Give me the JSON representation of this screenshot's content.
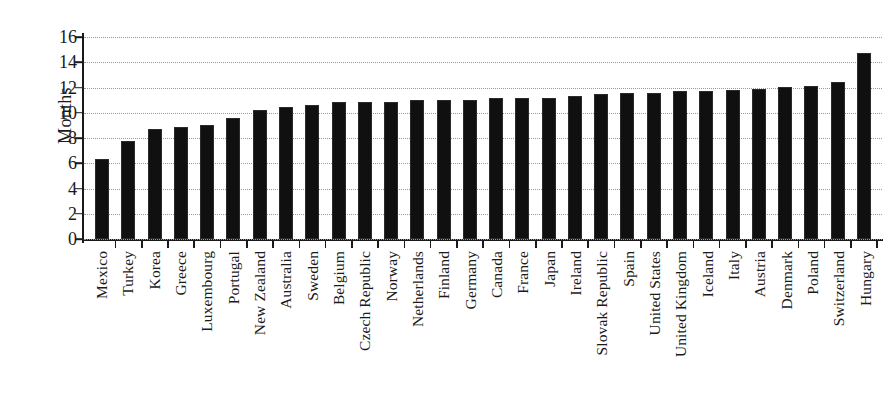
{
  "chart_data": {
    "type": "bar",
    "title": "",
    "xlabel": "",
    "ylabel": "Months",
    "ylim": [
      0,
      16
    ],
    "yticks": [
      0,
      2,
      4,
      6,
      8,
      10,
      12,
      14,
      16
    ],
    "grid": true,
    "legend": "none",
    "orientation": "vertical",
    "bar_color": "#101010",
    "categories": [
      "Mexico",
      "Turkey",
      "Korea",
      "Greece",
      "Luxembourg",
      "Portugal",
      "New Zealand",
      "Australia",
      "Sweden",
      "Belgium",
      "Czech Republic",
      "Norway",
      "Netherlands",
      "Finland",
      "Germany",
      "Canada",
      "France",
      "Japan",
      "Ireland",
      "Slovak Republic",
      "Spain",
      "United States",
      "United Kingdom",
      "Iceland",
      "Italy",
      "Austria",
      "Denmark",
      "Poland",
      "Switzerland",
      "Hungary"
    ],
    "values": [
      6.35,
      7.75,
      8.7,
      8.9,
      9.0,
      9.6,
      10.25,
      10.45,
      10.6,
      10.85,
      10.85,
      10.85,
      11.0,
      11.05,
      11.05,
      11.15,
      11.15,
      11.2,
      11.3,
      11.45,
      11.6,
      11.6,
      11.7,
      11.7,
      11.8,
      11.9,
      12.05,
      12.15,
      12.4,
      14.75
    ]
  }
}
